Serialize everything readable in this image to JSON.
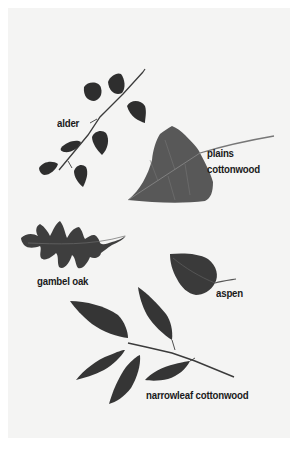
{
  "figure": {
    "type": "leaf identification illustration",
    "background_color": "#f4f4f3",
    "leaf_color": "#3a3a3a"
  },
  "leaves": [
    {
      "id": "alder",
      "label": "alder"
    },
    {
      "id": "plains-cottonwood",
      "label_line1": "plains",
      "label_line2": "cottonwood"
    },
    {
      "id": "gambel-oak",
      "label": "gambel oak"
    },
    {
      "id": "aspen",
      "label": "aspen"
    },
    {
      "id": "narrowleaf-cottonwood",
      "label": "narrowleaf cottonwood"
    }
  ]
}
